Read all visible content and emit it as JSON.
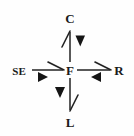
{
  "diagram": {
    "background_color": "#fefefe",
    "stroke_color": "#222222",
    "label_color": "#1a1a1a",
    "center": {
      "id": "F",
      "label": "F",
      "x": 70,
      "y": 70
    },
    "nodes": [
      {
        "id": "C",
        "label": "C",
        "position": "top",
        "x": 70,
        "y": 18
      },
      {
        "id": "R",
        "label": "R",
        "position": "right",
        "x": 119,
        "y": 70
      },
      {
        "id": "L",
        "label": "L",
        "position": "bottom",
        "x": 70,
        "y": 122
      },
      {
        "id": "SE",
        "label": "SE",
        "position": "left",
        "x": 19,
        "y": 70
      }
    ],
    "edges": [
      {
        "id": "edge-f-c",
        "from": "F",
        "to": "C",
        "direction": "up",
        "barb_side": "left",
        "solid_marker": "down-triangle",
        "solid_marker_glyph": "▼"
      },
      {
        "id": "edge-f-r",
        "from": "F",
        "to": "R",
        "direction": "right",
        "barb_side": "above",
        "solid_marker": "left-triangle",
        "solid_marker_glyph": "◄"
      },
      {
        "id": "edge-f-l",
        "from": "F",
        "to": "L",
        "direction": "down",
        "barb_side": "right",
        "solid_marker": "down-triangle",
        "solid_marker_glyph": "▼"
      },
      {
        "id": "edge-se-f",
        "from": "SE",
        "to": "F",
        "direction": "right",
        "barb_side": "above",
        "solid_marker": "right-triangle",
        "solid_marker_glyph": "►"
      }
    ]
  }
}
